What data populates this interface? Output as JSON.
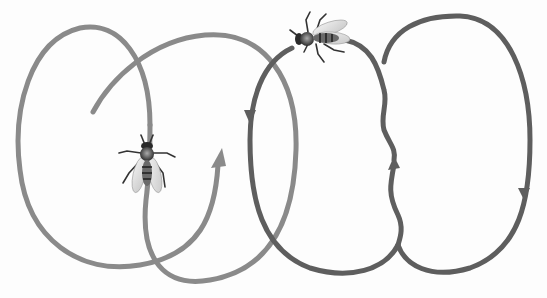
{
  "figure": {
    "background": "#fdfdfd",
    "round_dance": {
      "stroke_color": "#8a8a8a",
      "stroke_width": 5,
      "arrow_count": 1
    },
    "waggle_dance": {
      "stroke_color": "#5e5e5e",
      "stroke_width": 5,
      "arrow_count": 3
    },
    "bees": [
      {
        "name": "round-dance-bee",
        "orientation": "head-up"
      },
      {
        "name": "waggle-dance-bee",
        "orientation": "head-left"
      }
    ]
  }
}
